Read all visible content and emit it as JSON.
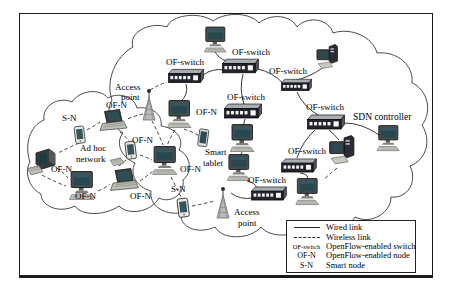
{
  "figure_labels": {
    "of_switch": "OF-switch",
    "of_n": "OF-N",
    "s_n": "S-N",
    "access_line1": "Access",
    "access_line2": "point",
    "adhoc_line1": "Ad hoc",
    "adhoc_line2": "network",
    "tablet_line1": "Smart",
    "tablet_line2": "tablet",
    "sdn_controller": "SDN controller"
  },
  "legend": {
    "rows": [
      {
        "key": "",
        "sample": "solid-line",
        "label": "Wired link"
      },
      {
        "key": "",
        "sample": "dashed-line",
        "label": "Wireless link"
      },
      {
        "key": "OF-switch",
        "label": "OpenFlow-enabled switch"
      },
      {
        "key": "OF-N",
        "label": "OpenFlow-enabled node"
      },
      {
        "key": "S-N",
        "label": "Smart node"
      }
    ]
  },
  "colors": {
    "link": "#3a3a3a",
    "cloud_outline": "#4a4a4a",
    "screen": "#2a4a52",
    "switch_body": "#23232d",
    "border": "#1b1b1b"
  }
}
